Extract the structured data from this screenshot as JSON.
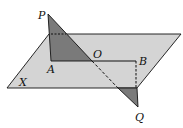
{
  "figure": {
    "colors": {
      "plane_fill": "#d4d4d4",
      "triangle_fill": "#7a7a7a",
      "stroke": "#111111",
      "background": "#ffffff"
    },
    "labels": {
      "P": "P",
      "A": "A",
      "O": "O",
      "B": "B",
      "X": "X",
      "Q": "Q"
    }
  }
}
